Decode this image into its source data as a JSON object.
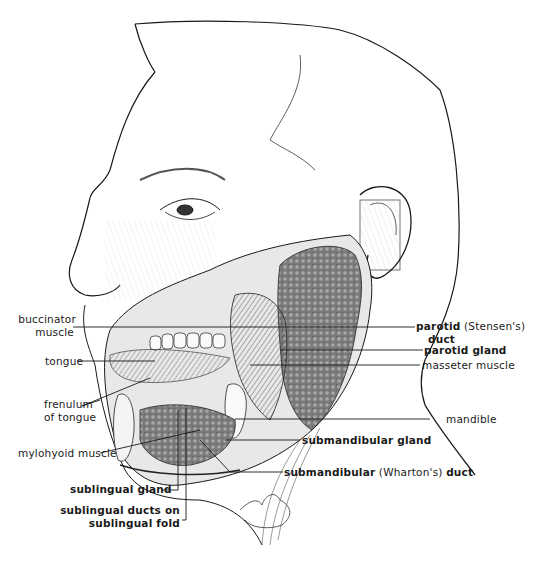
{
  "figure": {
    "colors": {
      "ink": "#1a1a1a",
      "gland_fill": "#6e6e6e",
      "background": "#ffffff"
    }
  },
  "labels_left": {
    "buccinator_line1": "buccinator",
    "buccinator_line2": "muscle",
    "tongue": "tongue",
    "frenulum_line1": "frenulum",
    "frenulum_line2": "of tongue",
    "mylohyoid": "mylohyoid muscle",
    "sublingual_gland": "sublingual gland",
    "sublingual_ducts_line1": "sublingual ducts on",
    "sublingual_ducts_line2": "sublingual fold"
  },
  "labels_right": {
    "parotid_duct_bold": "parotid",
    "parotid_duct_paren": "(Stensen's)",
    "parotid_duct_line2": "duct",
    "parotid_gland": "parotid gland",
    "masseter": "masseter muscle",
    "mandible": "mandible",
    "submandibular_gland": "submandibular gland",
    "submandibular_duct_bold": "submandibular",
    "submandibular_duct_paren": "(Wharton's)",
    "submandibular_duct_end": "duct"
  }
}
